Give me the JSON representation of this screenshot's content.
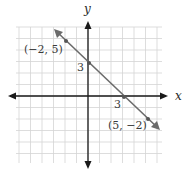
{
  "chart_data": {
    "type": "line",
    "title": "",
    "xlabel": "x",
    "ylabel": "y",
    "xlim": [
      -6,
      6
    ],
    "ylim": [
      -6,
      6
    ],
    "grid": true,
    "legend": null,
    "series": [
      {
        "name": "line",
        "equation": "y = -x + 3",
        "x": [
          -2,
          0,
          3,
          5
        ],
        "y": [
          5,
          3,
          0,
          -2
        ],
        "color": "#6b6b6b"
      }
    ],
    "annotations": [
      {
        "text": "(−2, 5)",
        "x": -2,
        "y": 5
      },
      {
        "text": "3",
        "x": 0,
        "y": 3,
        "role": "y-intercept"
      },
      {
        "text": "3",
        "x": 3,
        "y": 0,
        "role": "x-intercept"
      },
      {
        "text": "(5, −2)",
        "x": 5,
        "y": -2
      }
    ]
  },
  "labels": {
    "x_axis": "x",
    "y_axis": "y",
    "point_a": "(−2, 5)",
    "y_intercept": "3",
    "x_intercept": "3",
    "point_b": "(5, −2)"
  }
}
